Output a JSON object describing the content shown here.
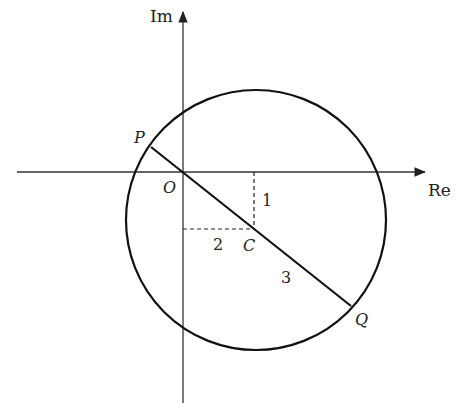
{
  "diagram": {
    "type": "complex-plane-circle",
    "axes": {
      "real_label": "Re",
      "imag_label": "Im"
    },
    "points": {
      "origin": "O",
      "center": "C",
      "p": "P",
      "q": "Q"
    },
    "measurements": {
      "horizontal_offset": "2",
      "vertical_offset": "1",
      "radius": "3"
    },
    "colors": {
      "stroke": "#111111",
      "axis": "#333333",
      "background": "#ffffff"
    }
  }
}
